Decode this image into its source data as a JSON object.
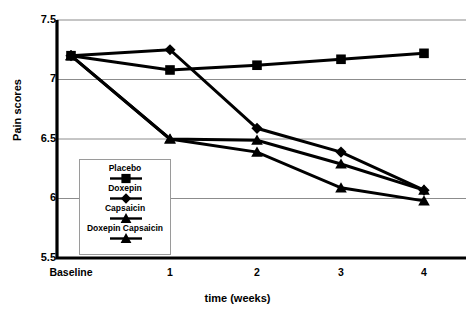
{
  "chart_data": {
    "type": "line",
    "title": "",
    "xlabel": "time (weeks)",
    "ylabel": "Pain scores",
    "categories": [
      "Baseline",
      "1",
      "2",
      "3",
      "4"
    ],
    "ylim": [
      5.5,
      7.5
    ],
    "ytick_labels": [
      "7.5",
      "7",
      "6.5",
      "6",
      "5.5"
    ],
    "ytick_values": [
      7.5,
      7.0,
      6.5,
      6.0,
      5.5
    ],
    "grid": "horizontal",
    "legend_position": "inside-lower-left",
    "series": [
      {
        "name": "Placebo",
        "marker": "square",
        "color": "#000000",
        "values": [
          7.2,
          7.08,
          7.12,
          7.17,
          7.22
        ]
      },
      {
        "name": "Doxepin",
        "marker": "diamond",
        "color": "#000000",
        "values": [
          7.2,
          7.25,
          6.59,
          6.39,
          6.07
        ]
      },
      {
        "name": "Capsaicin",
        "marker": "triangle",
        "color": "#000000",
        "values": [
          7.2,
          6.5,
          6.49,
          6.29,
          6.07
        ]
      },
      {
        "name": "Doxepin Capsaicin",
        "marker": "triangle",
        "color": "#000000",
        "values": [
          7.2,
          6.5,
          6.39,
          6.09,
          5.98
        ]
      }
    ]
  },
  "legend": {
    "entries": [
      {
        "label": "Placebo",
        "marker": "square"
      },
      {
        "label": "Doxepin",
        "marker": "diamond"
      },
      {
        "label": "Capsaicin",
        "marker": "triangle"
      },
      {
        "label": "Doxepin Capsaicin",
        "marker": "triangle"
      }
    ]
  },
  "colors": {
    "series": "#000000",
    "grid": "#8c8c8c",
    "axis": "#000000",
    "background": "#ffffff"
  }
}
